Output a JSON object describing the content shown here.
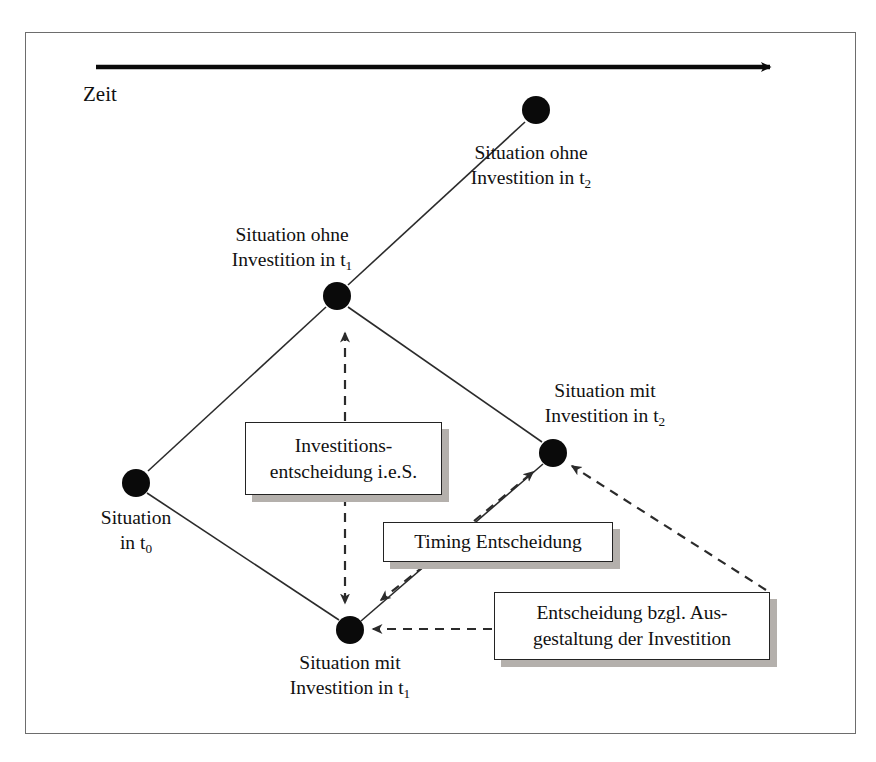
{
  "figure": {
    "axis": {
      "label": "Zeit",
      "direction": "right",
      "arrow_color": "#0a0a0a"
    }
  },
  "colors": {
    "node": "#0a0a0a",
    "edge": "#2b2b2b",
    "dashed": "#2b2b2b",
    "box_border": "#232323",
    "box_shadow": "#b4b0ac",
    "frame": "#6d6d6d",
    "background": "#ffffff"
  },
  "nodes": [
    {
      "id": "t0",
      "label_line1": "Situation",
      "label_line2": "in t",
      "label_sub": "0",
      "x": 136,
      "y": 483
    },
    {
      "id": "ohne_t1",
      "label_line1": "Situation ohne",
      "label_line2": "Investition in t",
      "label_sub": "1",
      "x": 337,
      "y": 296
    },
    {
      "id": "ohne_t2",
      "label_line1": "Situation ohne",
      "label_line2": "Investition in t",
      "label_sub": "2",
      "x": 536,
      "y": 110
    },
    {
      "id": "mit_t1",
      "label_line1": "Situation mit",
      "label_line2": "Investition in t",
      "label_sub": "1",
      "x": 350,
      "y": 630
    },
    {
      "id": "mit_t2",
      "label_line1": "Situation mit",
      "label_line2": "Investition in t",
      "label_sub": "2",
      "x": 553,
      "y": 453
    }
  ],
  "callouts": [
    {
      "id": "investitionsentscheidung",
      "line1": "Investitions-",
      "line2": "entscheidung i.e.S."
    },
    {
      "id": "timing",
      "line1": "Timing Entscheidung",
      "line2": ""
    },
    {
      "id": "ausgestaltung",
      "line1": "Entscheidung bzgl. Aus-",
      "line2": "gestaltung der Investition"
    }
  ],
  "edges": [
    {
      "from": "t0",
      "to": "ohne_t1",
      "style": "solid"
    },
    {
      "from": "ohne_t1",
      "to": "ohne_t2",
      "style": "solid"
    },
    {
      "from": "t0",
      "to": "mit_t1",
      "style": "solid"
    },
    {
      "from": "ohne_t1",
      "to": "mit_t2",
      "style": "solid"
    },
    {
      "from": "mit_t1",
      "to": "mit_t2",
      "style": "solid"
    }
  ],
  "connectors": [
    {
      "id": "inv-to-ohne-t1",
      "style": "dashed",
      "arrow": "end"
    },
    {
      "id": "inv-to-mit-t1",
      "style": "dashed",
      "arrow": "end"
    },
    {
      "id": "timing-to-mit-t2",
      "style": "dashed",
      "arrow": "end"
    },
    {
      "id": "timing-to-mit-t1",
      "style": "dashed",
      "arrow": "end"
    },
    {
      "id": "ausgest-to-mit-t2",
      "style": "dashed",
      "arrow": "end"
    },
    {
      "id": "ausgest-to-mit-t1",
      "style": "dashed",
      "arrow": "end"
    }
  ]
}
